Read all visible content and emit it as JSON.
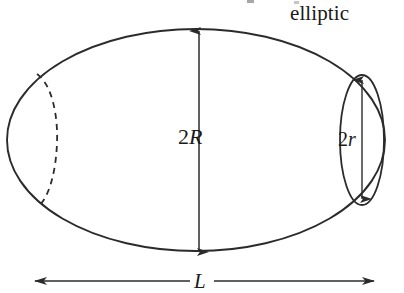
{
  "figure": {
    "kind": "geometry-diagram",
    "background_color": "#ffffff",
    "stroke_color": "#2b2b2b",
    "labels": {
      "shape_name": "elliptic",
      "major_diameter": {
        "prefix": "2",
        "variable": "R"
      },
      "minor_diameter": {
        "prefix": "2",
        "variable": "r"
      },
      "length": {
        "variable": "L"
      }
    },
    "geometry": {
      "outer_ellipse": {
        "cx": 196,
        "cy": 140,
        "rx": 189,
        "ry": 111
      },
      "right_cap_ellipse": {
        "cx": 362,
        "cy": 140,
        "rx": 22,
        "ry": 65
      },
      "left_cap_ellipse": {
        "cx": 22,
        "cy": 140,
        "rx": 20,
        "ry": 65,
        "hidden_half": "dashed"
      },
      "dimension_2R": {
        "x": 199,
        "y_top": 29,
        "y_bottom": 254
      },
      "dimension_2r": {
        "x": 362,
        "y_top": 78,
        "y_bottom": 201
      },
      "dimension_L": {
        "y": 281,
        "x_left": 33,
        "x_right": 376
      }
    }
  }
}
